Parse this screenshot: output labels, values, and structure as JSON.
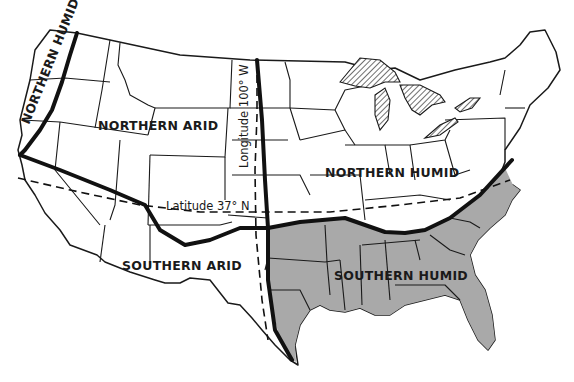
{
  "map": {
    "title": "Climatic regions of the United States",
    "regions": [
      {
        "id": "northern-humid-west",
        "label": "NORTHERN HUMID"
      },
      {
        "id": "northern-arid",
        "label": "NORTHERN ARID"
      },
      {
        "id": "northern-humid-east",
        "label": "NORTHERN HUMID"
      },
      {
        "id": "southern-arid",
        "label": "SOUTHERN ARID"
      },
      {
        "id": "southern-humid",
        "label": "SOUTHERN HUMID"
      }
    ],
    "reference_lines": {
      "longitude": "Longitude 100° W",
      "latitude": "Latitude 37° N"
    },
    "colors": {
      "shaded_region": "#a9a9a9",
      "line": "#111111",
      "background": "#ffffff"
    }
  }
}
